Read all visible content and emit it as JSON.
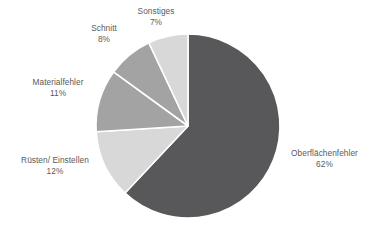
{
  "chart_data": {
    "type": "pie",
    "title": "",
    "subtitle": "",
    "xlabel": "",
    "ylabel": "",
    "legend": "none",
    "grid": false,
    "value_unit": "%",
    "categories": [
      "Oberflächenfehler",
      "Rüsten/ Einstellen",
      "Materialfehler",
      "Schnitt",
      "Sonstiges"
    ],
    "values": [
      62,
      12,
      11,
      8,
      7
    ],
    "slices": [
      {
        "label": "Oberflächenfehler",
        "value_label": "62%",
        "value": 62,
        "color": "#58585a",
        "start_angle_deg": 0,
        "end_angle_deg": 223.2
      },
      {
        "label": "Rüsten/ Einstellen",
        "value_label": "12%",
        "value": 12,
        "color": "#d8d8d8",
        "start_angle_deg": 223.2,
        "end_angle_deg": 266.4
      },
      {
        "label": "Materialfehler",
        "value_label": "11%",
        "value": 11,
        "color": "#a3a3a3",
        "start_angle_deg": 266.4,
        "end_angle_deg": 306.0
      },
      {
        "label": "Schnitt",
        "value_label": "8%",
        "value": 8,
        "color": "#a3a3a3",
        "start_angle_deg": 306.0,
        "end_angle_deg": 334.8
      },
      {
        "label": "Sonstiges",
        "value_label": "7%",
        "value": 7,
        "color": "#d8d8d8",
        "start_angle_deg": 334.8,
        "end_angle_deg": 360.0
      }
    ],
    "geometry": {
      "center_x": 188,
      "center_y": 126,
      "radius": 92,
      "separator_color": "#ffffff",
      "separator_width": 1.6
    },
    "label_text_color": "#5a5a5a",
    "background_color": "#ffffff"
  }
}
